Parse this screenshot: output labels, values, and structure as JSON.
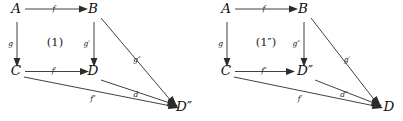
{
  "figure": {
    "type": "commutative-diagram-pair"
  },
  "diagrams": [
    {
      "id": "left",
      "region_label": "(1)",
      "nodes": [
        {
          "id": "A",
          "label": "A",
          "x": 16,
          "y": 13
        },
        {
          "id": "B",
          "label": "B",
          "x": 93,
          "y": 13
        },
        {
          "id": "C",
          "label": "C",
          "x": 16,
          "y": 75
        },
        {
          "id": "D",
          "label": "D",
          "x": 93,
          "y": 75
        },
        {
          "id": "Dpp",
          "label": "D″",
          "x": 184,
          "y": 108
        }
      ],
      "edges": [
        {
          "id": "A-B",
          "label": "f",
          "from": "A",
          "to": "B",
          "lx": 54,
          "ly": 11
        },
        {
          "id": "A-C",
          "label": "g",
          "from": "A",
          "to": "C",
          "lx": 13,
          "ly": 46
        },
        {
          "id": "B-D",
          "label": "g′",
          "from": "B",
          "to": "D",
          "lx": 90,
          "ly": 46
        },
        {
          "id": "C-D",
          "label": "f′",
          "from": "C",
          "to": "D",
          "lx": 54,
          "ly": 73
        },
        {
          "id": "B-Dpp",
          "label": "g″",
          "from": "B",
          "to": "Dpp",
          "lx": 137,
          "ly": 62
        },
        {
          "id": "C-Dpp",
          "label": "f″",
          "from": "C",
          "to": "Dpp",
          "lx": 93,
          "ly": 100
        },
        {
          "id": "D-Dpp",
          "label": "d",
          "from": "D",
          "to": "Dpp",
          "lx": 136,
          "ly": 97
        }
      ]
    },
    {
      "id": "right",
      "region_label": "(1″)",
      "nodes": [
        {
          "id": "A",
          "label": "A",
          "x": 226,
          "y": 13
        },
        {
          "id": "B",
          "label": "B",
          "x": 303,
          "y": 13
        },
        {
          "id": "C",
          "label": "C",
          "x": 226,
          "y": 75
        },
        {
          "id": "Dpp",
          "label": "D″",
          "x": 305,
          "y": 75
        },
        {
          "id": "D",
          "label": "D",
          "x": 388,
          "y": 108
        }
      ],
      "edges": [
        {
          "id": "A-B",
          "label": "f",
          "from": "A",
          "to": "B",
          "lx": 264,
          "ly": 11
        },
        {
          "id": "A-C",
          "label": "g",
          "from": "A",
          "to": "C",
          "lx": 223,
          "ly": 46
        },
        {
          "id": "B-Dpp",
          "label": "g″",
          "from": "B",
          "to": "Dpp",
          "lx": 299,
          "ly": 46
        },
        {
          "id": "C-Dpp",
          "label": "f″",
          "from": "C",
          "to": "Dpp",
          "lx": 264,
          "ly": 73
        },
        {
          "id": "B-D",
          "label": "g′",
          "from": "B",
          "to": "D",
          "lx": 347,
          "ly": 62
        },
        {
          "id": "C-D",
          "label": "f′",
          "from": "C",
          "to": "D",
          "lx": 300,
          "ly": 100
        },
        {
          "id": "Dpp-D",
          "label": "d″",
          "from": "Dpp",
          "to": "D",
          "lx": 344,
          "ly": 97
        }
      ]
    }
  ],
  "colors": {
    "background": "#ffffff",
    "ink": "#111111",
    "stroke": "#2b2b2b"
  }
}
